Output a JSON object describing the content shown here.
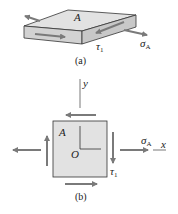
{
  "figure_a": {
    "caption": "(a)",
    "face_label": "A",
    "shear_label": "τ",
    "shear_sub": "1",
    "normal_label": "σ",
    "normal_sub": "A"
  },
  "figure_b": {
    "caption": "(b)",
    "face_label": "A",
    "origin_label": "O",
    "y_axis_label": "y",
    "x_axis_label": "x",
    "shear_label": "τ",
    "shear_sub": "1",
    "normal_label": "σ",
    "normal_sub": "A"
  },
  "colors": {
    "element_fill": "#e2e2e2",
    "element_side": "#cfcfcf",
    "arrow": "#7a7a7a",
    "outline": "#333333"
  }
}
